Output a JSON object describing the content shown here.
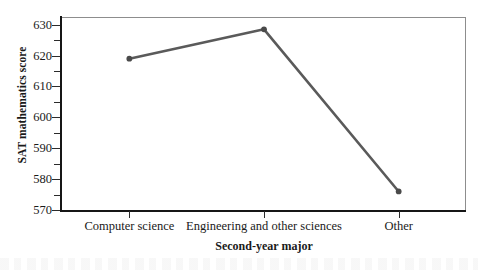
{
  "chart_data": {
    "type": "line",
    "title": "",
    "subtitle": "",
    "xlabel": "Second-year major",
    "ylabel": "SAT mathematics score",
    "categories": [
      "Computer science",
      "Engineering and other sciences",
      "Other"
    ],
    "values": [
      619,
      628.5,
      576
    ],
    "series": [
      {
        "name": "SAT mathematics score",
        "values": [
          619,
          628.5,
          576
        ]
      }
    ],
    "ylim": [
      570,
      632.5
    ],
    "xlim": [
      0,
      3
    ],
    "y_major_ticks": [
      630,
      620,
      610,
      600,
      590,
      580,
      570
    ],
    "y_minor_ticks": [
      625,
      615,
      605,
      595,
      585,
      575
    ],
    "y_tick_labels": [
      "630",
      "620",
      "610",
      "600",
      "590",
      "580",
      "570"
    ],
    "x_tick_labels": [
      "Computer science",
      "Engineering and other sciences",
      "Other"
    ],
    "grid": false,
    "legend": false,
    "legend_position": "none",
    "annotations": [],
    "colors": {
      "line": "#5a5a5a",
      "marker": "#4a4a4a",
      "axis": "#161616",
      "frame": "#8d8d8d",
      "text": "#1a1a1a",
      "background": "#ffffff"
    }
  }
}
